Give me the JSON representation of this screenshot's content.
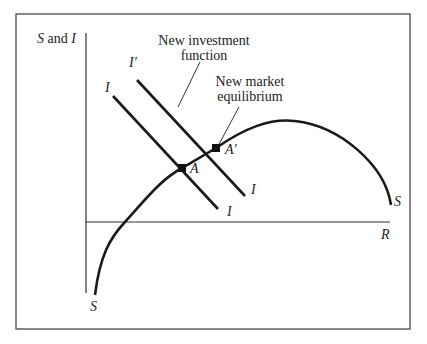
{
  "diagram": {
    "y_axis_label_s": "S",
    "y_axis_label_and": " and ",
    "y_axis_label_i": "I",
    "x_axis_label": "R",
    "curves": {
      "saving": {
        "label_top": "S",
        "label_bottom": "S"
      },
      "investment_original": {
        "label_top": "I",
        "label_bottom": "I"
      },
      "investment_new": {
        "label_top": "I′",
        "label_bottom": "I"
      }
    },
    "points": {
      "original_equilibrium": "A",
      "new_equilibrium": "A′"
    },
    "annotations": {
      "new_investment_line1": "New investment",
      "new_investment_line2": "function",
      "new_market_line1": "New market",
      "new_market_line2": "equilibrium"
    },
    "colors": {
      "line": "#1a1a1a",
      "frame": "#555555",
      "axis": "#333333"
    }
  }
}
